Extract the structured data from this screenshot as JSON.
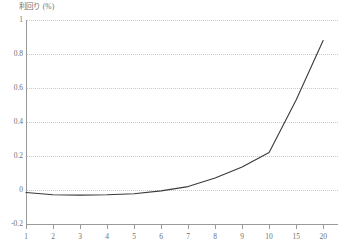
{
  "chart_data": {
    "type": "line",
    "title": "",
    "subtitle": "",
    "ylabel": "利回り (%)",
    "xlabel": "",
    "categories": [
      "1",
      "2",
      "3",
      "4",
      "5",
      "6",
      "7",
      "8",
      "9",
      "10",
      "15",
      "20"
    ],
    "x_tick_labels": [
      "1",
      "2",
      "3",
      "4",
      "5",
      "6",
      "7",
      "8",
      "9",
      "10",
      "15",
      "20"
    ],
    "y_tick_labels": [
      "1",
      "0.8",
      "0.6",
      "0.4",
      "0.2",
      "0",
      "-0.2"
    ],
    "y_tick_values": [
      1,
      0.8,
      0.6,
      0.4,
      0.2,
      0,
      -0.2
    ],
    "ylim": [
      -0.2,
      1
    ],
    "grid": true,
    "grid_style": "dotted-horizontal",
    "legend": false,
    "legend_position": "none",
    "x_scale": "categorical",
    "series": [
      {
        "name": "利回り",
        "color": "#3a3a3a",
        "values": [
          -0.015,
          -0.028,
          -0.03,
          -0.028,
          -0.022,
          -0.005,
          0.02,
          0.07,
          0.135,
          0.22,
          0.53,
          0.88
        ]
      }
    ],
    "annotations": []
  },
  "axes": {
    "y_axis_title": "利回り (%)",
    "axis_color": "#9a9a9a",
    "grid_color": "#c9c9c9",
    "text_color": "#6f6f6f"
  }
}
